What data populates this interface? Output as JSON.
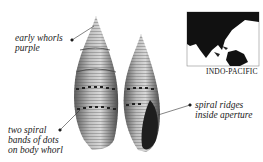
{
  "annotations": {
    "early_whorls": [
      "early whorls",
      "purple"
    ],
    "spiral_bands": [
      "two spiral",
      "bands of dots",
      "on body whorl"
    ],
    "spiral_ridges": [
      "spiral ridges",
      "inside aperture"
    ]
  },
  "map": {
    "region_label": "INDO-PACIFIC"
  },
  "colors": {
    "text": "#1a1a1a",
    "shell_dark": "#3a3a3a",
    "shell_light": "#c8c8c8",
    "map_land": "#111111"
  }
}
